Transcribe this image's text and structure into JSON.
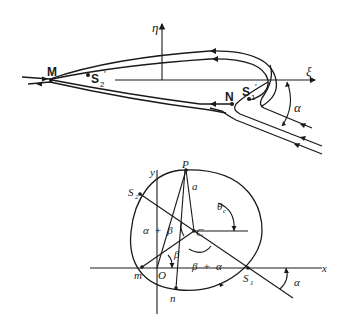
{
  "figure": {
    "top_panel": {
      "description": "Streamlines around a body in the physical (xi, eta) plane at angle of attack alpha",
      "axes": {
        "horizontal": "ξ",
        "vertical": "η"
      },
      "points": [
        {
          "label": "M",
          "sub": ""
        },
        {
          "label": "S",
          "sub": "2",
          "prime": "'"
        },
        {
          "label": "N",
          "sub": ""
        },
        {
          "label": "S",
          "sub": "1",
          "prime": "'"
        }
      ],
      "angle_label": "α"
    },
    "bottom_panel": {
      "description": "Circle with center C in the (x, y) plane with stagnation points S1, S2",
      "axes": {
        "horizontal": "x",
        "vertical": "y"
      },
      "points": {
        "P": "P",
        "C": "C",
        "O": "O",
        "m": "m",
        "n": "n",
        "S1": {
          "label": "S",
          "sub": "1"
        },
        "S2": {
          "label": "S",
          "sub": "2"
        }
      },
      "labels": {
        "radius": "a",
        "theta": "θ",
        "theta_sub": "c",
        "alpha_plus_beta": "α  +  β",
        "beta_upper": "β",
        "beta_lower": "β",
        "beta_plus_alpha": "β  +  α",
        "alpha": "α"
      }
    }
  }
}
